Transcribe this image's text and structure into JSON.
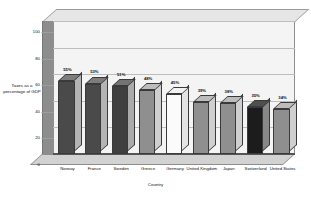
{
  "chart_data": {
    "type": "bar",
    "title": "",
    "subtitle": "",
    "xlabel": "Country",
    "ylabel": "Taxes as a percentage of GDP",
    "categories": [
      "Norway",
      "France",
      "Sweden",
      "Greece",
      "Germany",
      "United Kingdom",
      "Japan",
      "Switzerland",
      "United States"
    ],
    "values": [
      55,
      53,
      51,
      48,
      45,
      39,
      38,
      35,
      34
    ],
    "data_labels": [
      "55%",
      "53%",
      "51%",
      "48%",
      "45%",
      "39%",
      "38%",
      "35%",
      "34%"
    ],
    "bar_colors": [
      "#4a4a4a",
      "#4a4a4a",
      "#3f3f3f",
      "#8f8f8f",
      "#fbfbfb",
      "#8f8f8f",
      "#8f8f8f",
      "#1c1c1c",
      "#8f8f8f"
    ],
    "bar_side_colors": [
      "#b4b4b4",
      "#b4b4b4",
      "#ababab",
      "#cfcfcf",
      "#e4e4e4",
      "#cfcfcf",
      "#cfcfcf",
      "#888888",
      "#cfcfcf"
    ],
    "bar_top_colors": [
      "#7d7d7d",
      "#7d7d7d",
      "#747474",
      "#bcbcbc",
      "#f2f2f2",
      "#bcbcbc",
      "#bcbcbc",
      "#4f4f4f",
      "#bcbcbc"
    ],
    "ylim": [
      0,
      100
    ],
    "yticks": [
      0,
      20,
      40,
      60,
      80,
      100
    ],
    "ytick_labels": [
      "0",
      "20",
      "40",
      "60",
      "80",
      "100"
    ],
    "grid": true,
    "grid_axis": "y",
    "legend": false,
    "legend_position": "none",
    "style": "3d-column",
    "plot_background": "#f4f4f4",
    "figure_background": "#ffffff",
    "grid_color": "#bdbdbd",
    "axis_color": "#555555"
  }
}
